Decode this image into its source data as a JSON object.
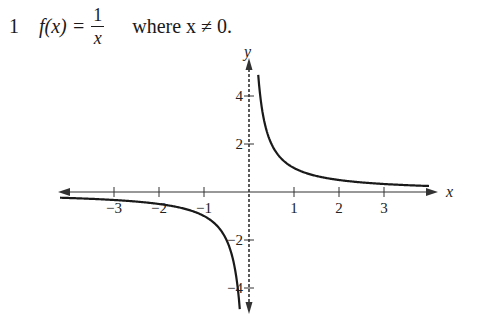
{
  "problem": {
    "number": "1",
    "function_lhs": "f(x) =",
    "numerator": "1",
    "denominator": "x",
    "condition": "where x ≠ 0."
  },
  "chart_data": {
    "type": "line",
    "xlabel": "x",
    "ylabel": "y",
    "x_ticks": [
      -3,
      -2,
      -1,
      1,
      2,
      3
    ],
    "y_ticks": [
      4,
      2,
      -2,
      -4
    ],
    "x_tick_labels": [
      "−3",
      "−2",
      "−1",
      "1",
      "2",
      "3"
    ],
    "y_tick_labels": [
      "4",
      "2",
      "−2",
      "−4"
    ],
    "xlim": [
      -4,
      4.1
    ],
    "ylim": [
      -5,
      5.5
    ],
    "grid": false,
    "asymptote": {
      "x": 0,
      "style": "dashed"
    },
    "series": [
      {
        "name": "f(x)=1/x (x>0)",
        "x": [
          0.2,
          0.25,
          0.33,
          0.5,
          1,
          1.5,
          2,
          3,
          4
        ],
        "y": [
          5,
          4,
          3,
          2,
          1,
          0.67,
          0.5,
          0.33,
          0.25
        ]
      },
      {
        "name": "f(x)=1/x (x<0)",
        "x": [
          -4,
          -3,
          -2,
          -1.5,
          -1,
          -0.5,
          -0.33,
          -0.25,
          -0.2
        ],
        "y": [
          -0.25,
          -0.33,
          -0.5,
          -0.67,
          -1,
          -2,
          -3,
          -4,
          -5
        ]
      }
    ],
    "colors": {
      "curve": "#1a1a1a",
      "axes": "#333333"
    }
  }
}
